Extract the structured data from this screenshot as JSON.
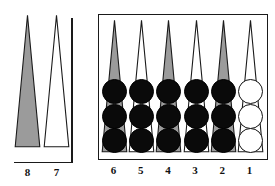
{
  "diagram": {
    "type": "backgammon-board",
    "colors": {
      "point_filled": "#9b9b9b",
      "point_open": "#ffffff",
      "point_outline": "#1a1a1a",
      "checker_black": "#0a0a0a",
      "checker_white": "#ffffff",
      "background": "#ffffff",
      "box_border": "#1a1a1a"
    }
  },
  "outer_panel": {
    "name": "outer-points",
    "points": [
      {
        "number": "8",
        "label": "8",
        "shade": "filled",
        "checkers": 0,
        "checker_color": "none"
      },
      {
        "number": "7",
        "label": "7",
        "shade": "open",
        "checkers": 0,
        "checker_color": "none"
      }
    ],
    "divider_bar": true
  },
  "home_panel": {
    "name": "home-board",
    "bordered": true,
    "points": [
      {
        "number": "6",
        "label": "6",
        "shade": "filled",
        "checkers": 3,
        "checker_color": "black"
      },
      {
        "number": "5",
        "label": "5",
        "shade": "open",
        "checkers": 3,
        "checker_color": "black"
      },
      {
        "number": "4",
        "label": "4",
        "shade": "filled",
        "checkers": 3,
        "checker_color": "black"
      },
      {
        "number": "3",
        "label": "3",
        "shade": "open",
        "checkers": 3,
        "checker_color": "black"
      },
      {
        "number": "2",
        "label": "2",
        "shade": "filled",
        "checkers": 3,
        "checker_color": "black"
      },
      {
        "number": "1",
        "label": "1",
        "shade": "open",
        "checkers": 3,
        "checker_color": "white"
      }
    ]
  }
}
